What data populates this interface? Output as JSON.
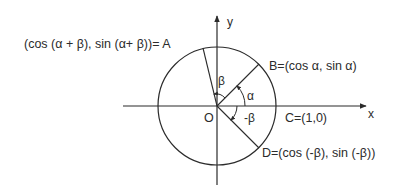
{
  "diagram": {
    "type": "unit-circle",
    "axes": {
      "x_label": "x",
      "y_label": "y"
    },
    "origin": {
      "label": "O"
    },
    "points": {
      "A": {
        "label": "(cos (α + β), sin (α+ β))= A",
        "angle_deg": 104
      },
      "B": {
        "label": "B=(cos α, sin α)",
        "angle_deg": 45
      },
      "C": {
        "label": "C=(1,0)",
        "angle_deg": 0
      },
      "D": {
        "label": "D=(cos (-β), sin (-β))",
        "angle_deg": -45
      }
    },
    "angles": {
      "alpha": "α",
      "beta": "β",
      "neg_beta": "-β"
    }
  }
}
